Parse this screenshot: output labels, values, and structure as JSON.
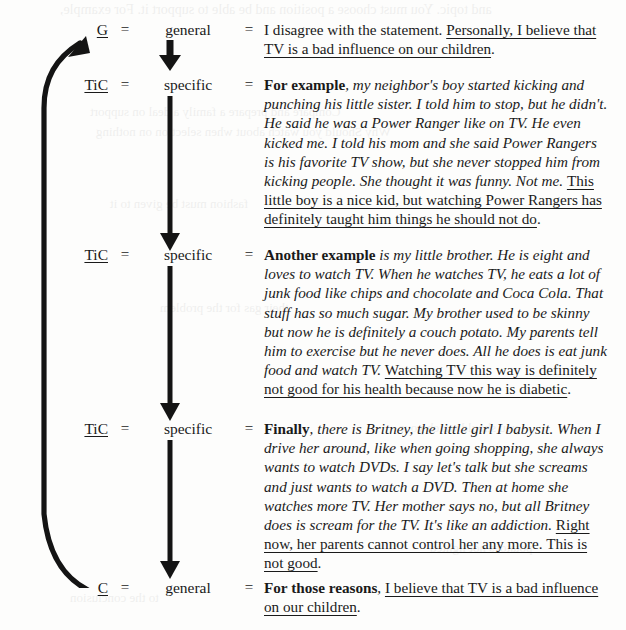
{
  "page": {
    "background_color": "#fdfdfc",
    "ink_color": "#1a1a1a"
  },
  "legend": {
    "equals": "=",
    "code_general": "G",
    "code_specific": "TiC",
    "code_conclusion": "C",
    "level_general": "general",
    "level_specific": "specific"
  },
  "rows": [
    {
      "code": "G",
      "eq1": "=",
      "level": "general",
      "eq2": "=",
      "segments": [
        {
          "style": "plain",
          "text": "I disagree with the statement. "
        },
        {
          "style": "plain-underline",
          "text": "Personally, I believe that TV is a bad influence on our children"
        },
        {
          "style": "plain",
          "text": "."
        }
      ]
    },
    {
      "code": "TiC",
      "eq1": "=",
      "level": "specific",
      "eq2": "=",
      "segments": [
        {
          "style": "bold",
          "text": "For example"
        },
        {
          "style": "italic",
          "text": ", my neighbor's boy started kicking and punching his little sister. I told him to stop, but he didn't. He said he was a Power Ranger like on TV. He even kicked me. I told his mom and she said Power Rangers is his favorite TV show, but she never stopped him from kicking people. She thought it was funny. Not me. "
        },
        {
          "style": "plain-underline",
          "text": "This little boy is a nice kid, but watching Power Rangers has definitely taught him things he should not do"
        },
        {
          "style": "plain",
          "text": "."
        }
      ]
    },
    {
      "code": "TiC",
      "eq1": "=",
      "level": "specific",
      "eq2": "=",
      "segments": [
        {
          "style": "bold",
          "text": "Another example"
        },
        {
          "style": "italic",
          "text": " is my little brother. He is eight and loves to watch TV. When he watches TV, he eats a lot of junk food like chips and chocolate and Coca Cola. That stuff has so much sugar. My brother used to be skinny but now he is definitely a couch potato. My parents tell him to  exercise but he never does. All he does is eat junk food and watch TV. "
        },
        {
          "style": "plain-underline",
          "text": "Watching TV this way is definitely not good for his health because now he is diabetic"
        },
        {
          "style": "plain",
          "text": "."
        }
      ]
    },
    {
      "code": "TiC",
      "eq1": "=",
      "level": "specific",
      "eq2": "=",
      "segments": [
        {
          "style": "bold",
          "text": "Finally"
        },
        {
          "style": "italic",
          "text": ", there is Britney, the little girl I babysit. When I drive her around, like when going shopping, she always wants to watch DVDs. I say let's talk but she screams and just wants to watch a DVD. Then at home she watches more TV. Her mother says no, but all Britney does is scream for the TV. It's like an addiction. "
        },
        {
          "style": "plain-underline",
          "text": "Right now, her parents cannot control her any more. This is not good"
        },
        {
          "style": "plain",
          "text": "."
        }
      ]
    },
    {
      "code": "C",
      "eq1": "=",
      "level": "general",
      "eq2": "=",
      "segments": [
        {
          "style": "bold",
          "text": "For those reasons"
        },
        {
          "style": "plain",
          "text": ", "
        },
        {
          "style": "plain-underline",
          "text": "I believe that TV is a bad influence on our children"
        },
        {
          "style": "plain",
          "text": "."
        }
      ]
    }
  ],
  "arrows": {
    "down_arrow_name": "down-arrow",
    "return_arrow_name": "return-arrow"
  },
  "bleed_text": [
    "and topic. You must choose a position and be able to support it. For example,",
    "Compare and prepare a family a deal on support",
    "Why Should you watch about when selection on nothing",
    "fashion must be given to it",
    "their gas for the problem",
    "you should watch your",
    "potatoes not lighted",
    "to the conclusion"
  ]
}
